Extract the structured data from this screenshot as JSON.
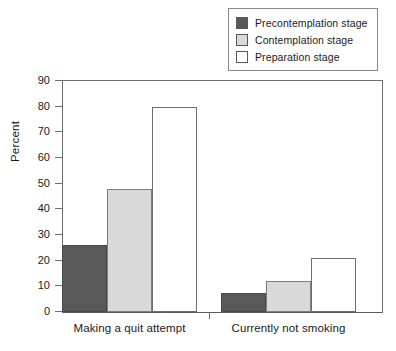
{
  "chart_data": {
    "type": "bar",
    "title": "",
    "subtitle": "",
    "xlabel": "",
    "ylabel": "Percent",
    "ylim": [
      0,
      90
    ],
    "yticks": [
      0,
      10,
      20,
      30,
      40,
      50,
      60,
      70,
      80,
      90
    ],
    "grid": false,
    "legend_position": "top-right",
    "categories": [
      "Making a quit attempt",
      "Currently not smoking"
    ],
    "series": [
      {
        "name": "Precontemplation stage",
        "color": "#595959",
        "values": [
          26,
          7.5
        ]
      },
      {
        "name": "Contemplation stage",
        "color": "#d9d9d9",
        "values": [
          48,
          12
        ]
      },
      {
        "name": "Preparation stage",
        "color": "#ffffff",
        "values": [
          80,
          21
        ]
      }
    ]
  },
  "legend": {
    "entries": [
      {
        "label": "Precontemplation stage",
        "swatch": "dark-gray"
      },
      {
        "label": "Contemplation stage",
        "swatch": "light-gray"
      },
      {
        "label": "Preparation stage",
        "swatch": "white"
      }
    ]
  },
  "axis": {
    "y_title": "Percent",
    "y_tick_labels": [
      "90",
      "80",
      "70",
      "60",
      "50",
      "40",
      "30",
      "20",
      "10",
      "0"
    ],
    "x_tick_labels": [
      "Making a quit attempt",
      "Currently not smoking"
    ]
  }
}
